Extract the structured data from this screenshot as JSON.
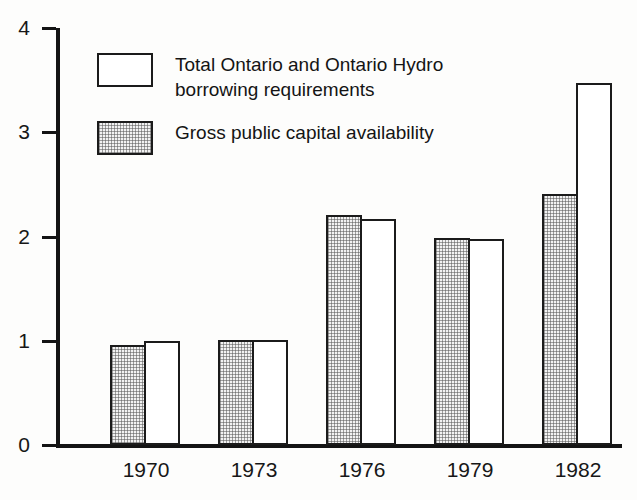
{
  "chart_data": {
    "type": "bar",
    "title": "",
    "subtitle": "",
    "xlabel": "",
    "ylabel": "",
    "categories": [
      "1970",
      "1973",
      "1976",
      "1979",
      "1982"
    ],
    "series": [
      {
        "name": "Gross public capital availability",
        "style": "hatched",
        "values": [
          0.96,
          1.01,
          2.21,
          1.99,
          2.41
        ]
      },
      {
        "name": "Total Ontario and Ontario Hydro borrowing requirements",
        "style": "open",
        "values": [
          1.0,
          1.01,
          2.17,
          1.98,
          3.47
        ]
      }
    ],
    "ylim": [
      0,
      4
    ],
    "yticks": [
      0,
      1,
      2,
      3,
      4
    ],
    "ytick_labels": [
      "0",
      "1",
      "2",
      "3",
      "4"
    ],
    "grid": false,
    "legend_position": "inside-top-left",
    "legend": [
      {
        "style": "open",
        "label": "Total Ontario and Ontario Hydro\nborrowing requirements"
      },
      {
        "style": "hatched",
        "label": "Gross public capital availability"
      }
    ],
    "colors": {
      "axis": "#141414",
      "bar_outline": "#1b1b1b",
      "bar_open_fill": "#ffffff",
      "bar_hatched_fill": "#f2f2f2",
      "background": "#fdfdfc"
    }
  }
}
